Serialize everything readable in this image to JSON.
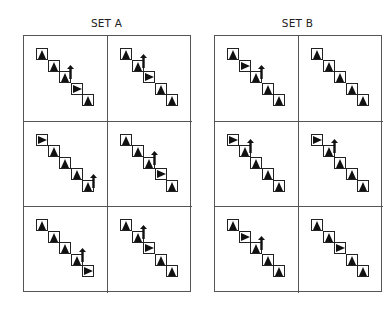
{
  "sets": [
    {
      "title": "SET A",
      "cells": [
        {
          "glyphs": [
            "up",
            "up",
            "up",
            "right",
            "up"
          ],
          "arrow_at": 2
        },
        {
          "glyphs": [
            "up",
            "up",
            "right",
            "up",
            "up"
          ],
          "arrow_at": 1
        },
        {
          "glyphs": [
            "right",
            "up",
            "up",
            "up",
            "up"
          ],
          "arrow_at": 4
        },
        {
          "glyphs": [
            "up",
            "up",
            "up",
            "right",
            "up"
          ],
          "arrow_at": 2
        },
        {
          "glyphs": [
            "up",
            "up",
            "up",
            "up",
            "right"
          ],
          "arrow_at": 3
        },
        {
          "glyphs": [
            "up",
            "up",
            "right",
            "up",
            "up"
          ],
          "arrow_at": 1
        }
      ]
    },
    {
      "title": "SET B",
      "cells": [
        {
          "glyphs": [
            "up",
            "right",
            "up",
            "up",
            "up"
          ],
          "arrow_at": 2
        },
        {
          "glyphs": [
            "up",
            "up",
            "up",
            "up",
            "up"
          ],
          "arrow_at": -1
        },
        {
          "glyphs": [
            "right",
            "up",
            "up",
            "up",
            "up"
          ],
          "arrow_at": 1
        },
        {
          "glyphs": [
            "right",
            "up",
            "up",
            "up",
            "up"
          ],
          "arrow_at": 1
        },
        {
          "glyphs": [
            "up",
            "right",
            "up",
            "up",
            "up"
          ],
          "arrow_at": 2
        },
        {
          "glyphs": [
            "up",
            "up",
            "right",
            "up",
            "up"
          ],
          "arrow_at": -1
        }
      ]
    }
  ]
}
